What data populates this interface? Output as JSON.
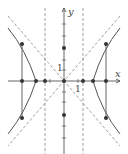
{
  "diagram": {
    "type": "hyperbola",
    "axis_labels": {
      "x": "x",
      "y": "y"
    },
    "tick_labels": {
      "x_unit": "1",
      "y_unit": "1"
    },
    "colors": {
      "curve": "#555555",
      "axis": "#555555",
      "dashed": "#888888",
      "point": "#333333"
    },
    "points": [
      {
        "name": "center",
        "x": 64,
        "y": 81
      },
      {
        "name": "focus-left",
        "x": 22,
        "y": 81
      },
      {
        "name": "focus-right",
        "x": 106,
        "y": 81
      },
      {
        "name": "vertex-left",
        "x": 36,
        "y": 81
      },
      {
        "name": "vertex-right",
        "x": 93,
        "y": 81
      },
      {
        "name": "directrix-left-pt",
        "x": 45,
        "y": 81
      },
      {
        "name": "directrix-right-pt",
        "x": 83,
        "y": 81
      },
      {
        "name": "co-vertex-top",
        "x": 64,
        "y": 48
      },
      {
        "name": "co-vertex-bottom",
        "x": 64,
        "y": 115
      },
      {
        "name": "latus-left-top",
        "x": 22,
        "y": 44
      },
      {
        "name": "latus-left-bottom",
        "x": 22,
        "y": 118
      },
      {
        "name": "latus-right-top",
        "x": 106,
        "y": 44
      },
      {
        "name": "latus-right-bottom",
        "x": 106,
        "y": 118
      }
    ]
  }
}
